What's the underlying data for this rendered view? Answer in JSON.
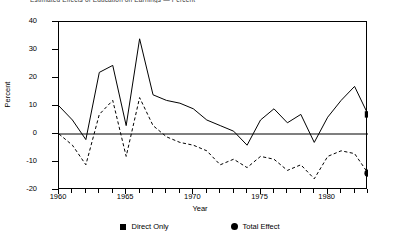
{
  "chart_data": {
    "type": "line",
    "title": "Estimated Effects of Education on Earnings — Percent",
    "xlabel": "Year",
    "ylabel": "Percent",
    "xlim": [
      1960,
      1983
    ],
    "ylim": [
      -20,
      40
    ],
    "yticks": [
      -20,
      -10,
      0,
      10,
      20,
      30,
      40
    ],
    "xticks": [
      1960,
      1965,
      1970,
      1975,
      1980
    ],
    "x_minor_step": 1,
    "grid": false,
    "zero_line": true,
    "legend_position": "bottom",
    "x": [
      1960,
      1961,
      1962,
      1963,
      1964,
      1965,
      1966,
      1967,
      1968,
      1969,
      1970,
      1971,
      1972,
      1973,
      1974,
      1975,
      1976,
      1977,
      1978,
      1979,
      1980,
      1981,
      1982,
      1983
    ],
    "series": [
      {
        "name": "Direct Only",
        "style": "solid",
        "marker": "square",
        "end_marker_value": 7,
        "values": [
          10,
          5,
          -2,
          22,
          24.5,
          3,
          34,
          14,
          12,
          11,
          9,
          5,
          3,
          1,
          -4,
          5,
          9,
          4,
          7,
          -3,
          6,
          12,
          17,
          7
        ]
      },
      {
        "name": "Total Effect",
        "style": "dashed",
        "marker": "circle",
        "end_marker_value": -14,
        "values": [
          0,
          -4,
          -11,
          7,
          12,
          -8,
          13,
          3,
          -1,
          -3,
          -4,
          -6,
          -11,
          -9,
          -12,
          -8,
          -9,
          -13,
          -11,
          -16,
          -8,
          -6,
          -7,
          -14
        ]
      }
    ]
  },
  "legend": {
    "items": [
      {
        "label": "Direct Only",
        "marker": "square-marker-icon"
      },
      {
        "label": "Total Effect",
        "marker": "circle-marker-icon"
      }
    ]
  },
  "axes": {
    "y_title": "Percent",
    "x_title": "Year",
    "y_labels": [
      "40",
      "30",
      "20",
      "10",
      "0",
      "-10",
      "-20"
    ],
    "x_labels": [
      "1960",
      "1965",
      "1970",
      "1975",
      "1980"
    ]
  }
}
